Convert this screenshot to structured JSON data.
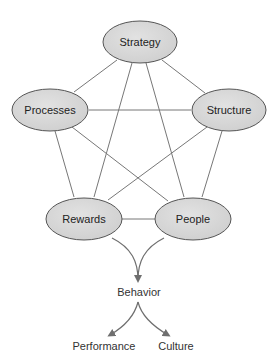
{
  "diagram": {
    "colors": {
      "node_fill": "#d9d9d9",
      "node_stroke": "#555555",
      "edge": "#777777",
      "arrow": "#6f6f6f"
    },
    "nodes": [
      {
        "id": "strategy",
        "label": "Strategy"
      },
      {
        "id": "processes",
        "label": "Processes"
      },
      {
        "id": "structure",
        "label": "Structure"
      },
      {
        "id": "rewards",
        "label": "Rewards"
      },
      {
        "id": "people",
        "label": "People"
      }
    ],
    "edges": [
      [
        "Strategy",
        "Processes"
      ],
      [
        "Strategy",
        "Structure"
      ],
      [
        "Strategy",
        "Rewards"
      ],
      [
        "Strategy",
        "People"
      ],
      [
        "Processes",
        "Structure"
      ],
      [
        "Processes",
        "Rewards"
      ],
      [
        "Processes",
        "People"
      ],
      [
        "Structure",
        "Rewards"
      ],
      [
        "Structure",
        "People"
      ],
      [
        "Rewards",
        "People"
      ]
    ],
    "outcomes": {
      "behavior": "Behavior",
      "performance": "Performance",
      "culture": "Culture"
    },
    "flows": [
      [
        "Rewards",
        "Behavior"
      ],
      [
        "People",
        "Behavior"
      ],
      [
        "Behavior",
        "Performance"
      ],
      [
        "Behavior",
        "Culture"
      ]
    ]
  }
}
